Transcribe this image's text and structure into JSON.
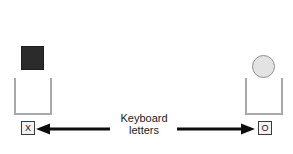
{
  "diagram": {
    "background_color": "#ffffff",
    "caption": {
      "line1": "Keyboard",
      "line2": "letters"
    },
    "left": {
      "object_name": "black square block",
      "object_shape": "square",
      "object_color": "#2b2b2b",
      "container_name": "open-top container",
      "container_color": "#a9a9a9",
      "key_label": "X",
      "arrow_direction": "left"
    },
    "right": {
      "object_name": "light gray ball",
      "object_shape": "circle",
      "object_color": "#e3e3e3",
      "container_name": "open-top container",
      "container_color": "#a9a9a9",
      "key_label": "O",
      "arrow_direction": "right"
    },
    "arrow_color": "#0d0d0d"
  }
}
